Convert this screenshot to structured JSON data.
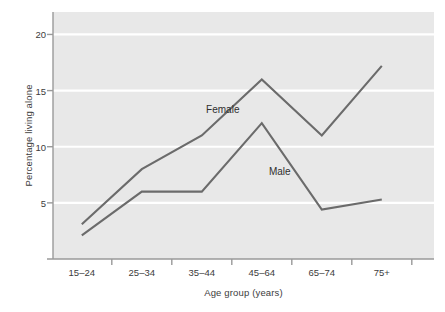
{
  "chart_data": {
    "type": "line",
    "title": "",
    "xlabel": "Age group (years)",
    "ylabel": "Percentage living alone",
    "categories": [
      "15–24",
      "25–34",
      "35–44",
      "45–64",
      "65–74",
      "75+"
    ],
    "ytick_labels": [
      "5",
      "10",
      "15",
      "20"
    ],
    "ytick_values": [
      5,
      10,
      15,
      20
    ],
    "ylim": [
      0,
      22
    ],
    "xlim_categories": 6,
    "grid": "horizontal-white-lines",
    "legend": "inline-annotations",
    "plot_background": "#e8e8e8",
    "gridline_color": "#ffffff",
    "line_color": "#6b6b6b",
    "axis_color": "#9a9a9a",
    "series": [
      {
        "name": "Female",
        "values": [
          3.1,
          8.0,
          11.0,
          16.0,
          11.0,
          17.2
        ],
        "label_text": "Female",
        "label_x_category_fraction": 2.35,
        "label_y_value": 13.4
      },
      {
        "name": "Male",
        "values": [
          2.1,
          6.0,
          6.0,
          12.1,
          4.4,
          5.3
        ],
        "label_text": "Male",
        "label_x_category_fraction": 3.3,
        "label_y_value": 7.8
      }
    ]
  }
}
